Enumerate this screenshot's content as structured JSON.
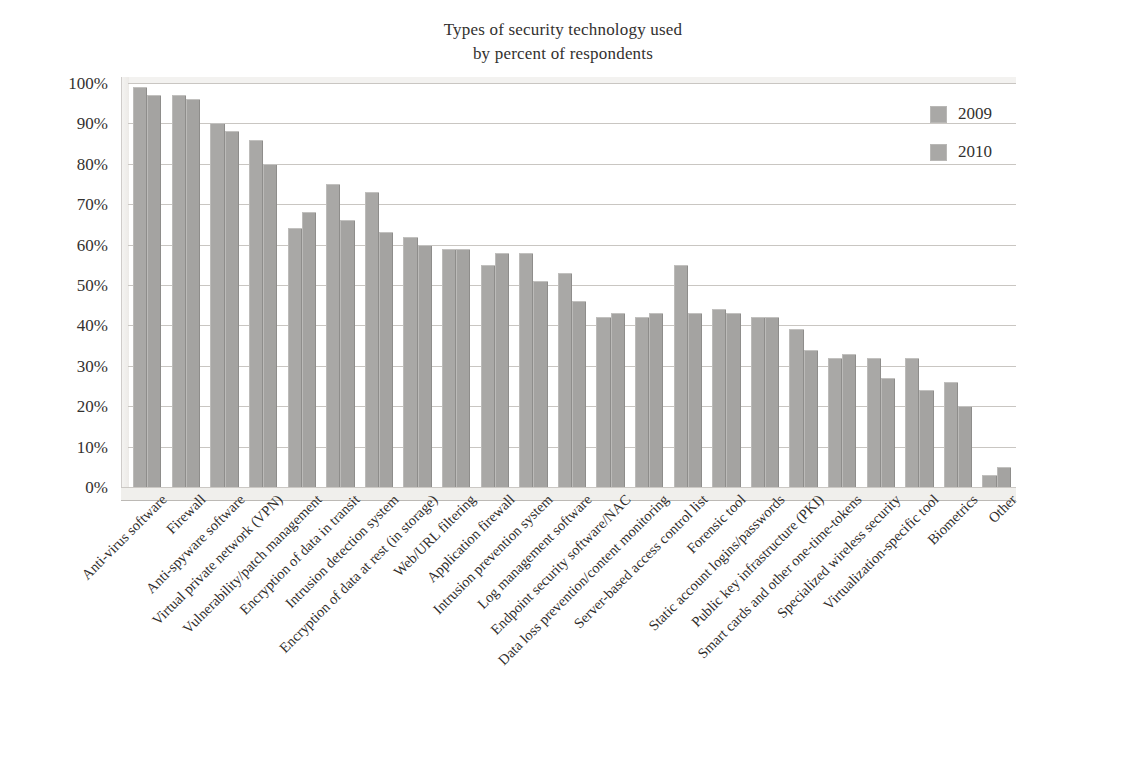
{
  "title": {
    "line1": "Types of security technology used",
    "line2": "by percent of respondents"
  },
  "legend": {
    "items": [
      {
        "label": "2009",
        "color": "#a9a8a6"
      },
      {
        "label": "2010",
        "color": "#a4a3a1"
      }
    ]
  },
  "axis": {
    "y_ticks": [
      "0%",
      "10%",
      "20%",
      "30%",
      "40%",
      "50%",
      "60%",
      "70%",
      "80%",
      "90%",
      "100%"
    ]
  },
  "chart_data": {
    "type": "bar",
    "title": "Types of security technology used by percent of respondents",
    "xlabel": "",
    "ylabel": "",
    "ylim": [
      0,
      100
    ],
    "ytick_labels": [
      "0%",
      "10%",
      "20%",
      "30%",
      "40%",
      "50%",
      "60%",
      "70%",
      "80%",
      "90%",
      "100%"
    ],
    "grid": true,
    "legend_position": "upper-right",
    "categories": [
      "Anti-virus software",
      "Firewall",
      "Anti-spyware software",
      "Virtual private network (VPN)",
      "Vulnerability/patch management",
      "Encryption of data in transit",
      "Intrusion detection system",
      "Encryption of data at rest (in storage)",
      "Web/URL filtering",
      "Application firewall",
      "Intrusion prevention system",
      "Log management software",
      "Endpoint security software/NAC",
      "Data loss prevention/content monitoring",
      "Server-based access control list",
      "Forensic tool",
      "Static account logins/passwords",
      "Public key infrastructure (PKI)",
      "Smart cards and other one-time-tokens",
      "Specialized wireless security",
      "Virtualization-specific tool",
      "Biometrics",
      "Other"
    ],
    "series": [
      {
        "name": "2009",
        "values": [
          99,
          97,
          90,
          86,
          64,
          75,
          73,
          62,
          59,
          55,
          58,
          53,
          42,
          42,
          55,
          44,
          42,
          39,
          32,
          32,
          32,
          26,
          3
        ]
      },
      {
        "name": "2010",
        "values": [
          97,
          96,
          88,
          80,
          68,
          66,
          63,
          60,
          59,
          58,
          51,
          46,
          43,
          43,
          43,
          43,
          42,
          34,
          33,
          27,
          24,
          20,
          5
        ]
      }
    ]
  }
}
